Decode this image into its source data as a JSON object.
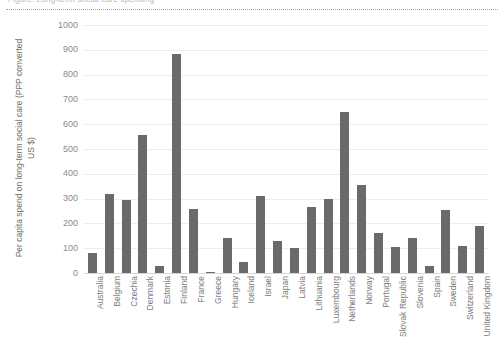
{
  "header": {
    "clipped_heading": "Figure: Long-term social care spending",
    "divider": "dotted-rule"
  },
  "chart_data": {
    "type": "bar",
    "title": "",
    "xlabel": "",
    "ylabel": "Per capita spend on long-term social care (PPP converted US $)",
    "ylim": [
      0,
      1000
    ],
    "ytick_step": 100,
    "grid": true,
    "legend": false,
    "bar_color": "#6a6a6a",
    "ytick_labels": [
      "1000",
      "900",
      "800",
      "700",
      "600",
      "500",
      "400",
      "300",
      "200",
      "100",
      "0"
    ],
    "categories": [
      "Australia",
      "Belgium",
      "Czechia",
      "Denmark",
      "Estonia",
      "Finland",
      "France",
      "Greece",
      "Hungary",
      "Iceland",
      "Israel",
      "Japan",
      "Latvia",
      "Lithuania",
      "Luxembourg",
      "Netherlands",
      "Norway",
      "Portugal",
      "Slovak Republic",
      "Slovenia",
      "Spain",
      "Sweden",
      "Switzerland",
      "United Kingdom"
    ],
    "values": [
      80,
      320,
      295,
      555,
      30,
      885,
      260,
      5,
      140,
      45,
      310,
      130,
      100,
      265,
      300,
      650,
      355,
      160,
      105,
      140,
      30,
      255,
      110,
      190
    ]
  }
}
